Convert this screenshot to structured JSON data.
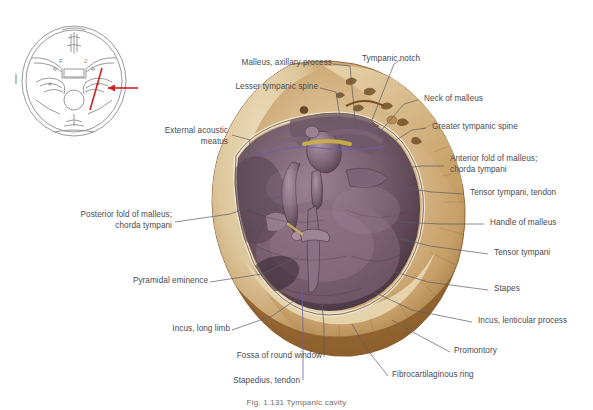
{
  "figure": {
    "caption": "Fig. 1.131   Tympanic cavity",
    "inset": {
      "name": "skull-base-schematic",
      "section_line_color": "#cc2222",
      "arrow_color": "#cc2222",
      "outline_color": "#8a8a90"
    },
    "palette": {
      "bone_light": "#e3d2ad",
      "bone_mid": "#c9a876",
      "bone_dark": "#8d6333",
      "mucosa_light": "#8e7585",
      "mucosa_mid": "#6b5260",
      "mucosa_dark": "#4a3743",
      "label_text": "#4a4a52",
      "leader_line": "#5b5b63",
      "accent_red": "#cc2222",
      "tendon_yellow": "#c9b048",
      "chorda_violet": "#6b5ea8"
    }
  },
  "labels": [
    {
      "id": "malleus-axillary-process",
      "text": "Malleus, axillary process"
    },
    {
      "id": "tympanic-notch",
      "text": "Tympanic notch"
    },
    {
      "id": "lesser-tympanic-spine",
      "text": "Lesser tympanic spine"
    },
    {
      "id": "neck-of-malleus",
      "text": "Neck of malleus"
    },
    {
      "id": "external-acoustic-meatus",
      "text": "External acoustic\nmeatus"
    },
    {
      "id": "greater-tympanic-spine",
      "text": "Greater tympanic spine"
    },
    {
      "id": "anterior-fold-of-malleus",
      "text": "Anterior fold of malleus;\nchorda tympani"
    },
    {
      "id": "tensor-tympani-tendon",
      "text": "Tensor tympani, tendon"
    },
    {
      "id": "posterior-fold-of-malleus",
      "text": "Posterior fold of malleus;\nchorda tympani"
    },
    {
      "id": "handle-of-malleus",
      "text": "Handle of malleus"
    },
    {
      "id": "tensor-tympani",
      "text": "Tensor tympani"
    },
    {
      "id": "pyramidal-eminence",
      "text": "Pyramidal eminence"
    },
    {
      "id": "stapes",
      "text": "Stapes"
    },
    {
      "id": "incus-long-limb",
      "text": "Incus, long limb"
    },
    {
      "id": "incus-lenticular-process",
      "text": "Incus, lenticular process"
    },
    {
      "id": "fossa-of-round-window",
      "text": "Fossa of round window"
    },
    {
      "id": "promontory",
      "text": "Promontory"
    },
    {
      "id": "stapedius-tendon",
      "text": "Stapedius, tendon"
    },
    {
      "id": "fibrocartilaginous-ring",
      "text": "Fibrocartilaginous ring"
    }
  ]
}
